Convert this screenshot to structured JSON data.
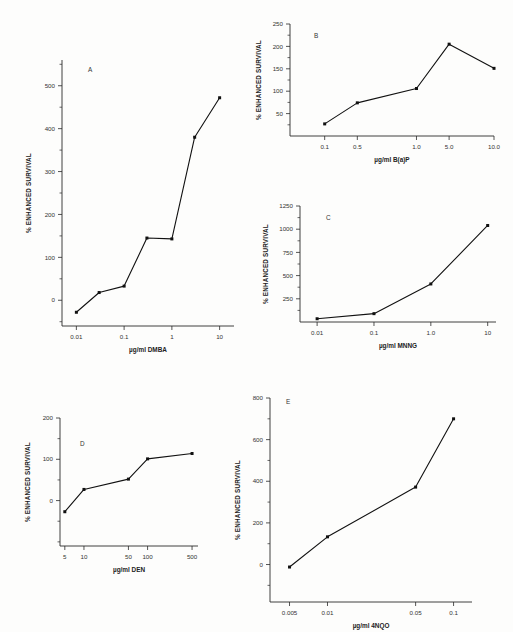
{
  "figure": {
    "title": "",
    "panel_count": 5
  },
  "chart_data": [
    {
      "id": "A",
      "panel_letter": "A",
      "type": "line",
      "title": "",
      "xlabel": "µg/ml DMBA",
      "ylabel": "% ENHANCED SURVIVAL",
      "xscale": "log",
      "xlim": [
        0.005,
        20
      ],
      "ylim": [
        -60,
        560
      ],
      "xticks": [
        0.01,
        0.1,
        1,
        10
      ],
      "xticklabels": [
        "0.01",
        "0.1",
        "1",
        "10"
      ],
      "yticks": [
        0,
        100,
        200,
        300,
        400,
        500
      ],
      "yticklabels": [
        "0",
        "100",
        "200",
        "300",
        "400",
        "500"
      ],
      "yminorticks": [
        -50,
        50,
        150,
        250,
        350,
        450,
        550
      ],
      "grid": false,
      "legend": "none",
      "x": [
        0.01,
        0.03,
        0.1,
        0.3,
        1.0,
        3.0,
        10.0
      ],
      "values": [
        -28,
        18,
        33,
        145,
        143,
        380,
        472
      ]
    },
    {
      "id": "B",
      "panel_letter": "B",
      "type": "line",
      "title": "",
      "xlabel": "µg/ml B(a)P",
      "ylabel": "% ENHANCED SURVIVAL",
      "xscale": "category",
      "ylim": [
        0,
        250
      ],
      "xticks": [
        0.1,
        0.5,
        1.0,
        5.0,
        10.0
      ],
      "xticklabels": [
        "0.1",
        "0.5",
        "1.0",
        "5.0",
        "10.0"
      ],
      "yticks": [
        50,
        100,
        150,
        200,
        250
      ],
      "yticklabels": [
        "50",
        "100",
        "150",
        "200",
        "250"
      ],
      "yminorticks": [
        25,
        75,
        125,
        175,
        225
      ],
      "grid": false,
      "legend": "none",
      "x": [
        0.1,
        0.5,
        1.0,
        5.0,
        10.0
      ],
      "values": [
        27,
        74,
        106,
        205,
        151
      ]
    },
    {
      "id": "C",
      "panel_letter": "C",
      "type": "line",
      "title": "",
      "xlabel": "µg/ml MNNG",
      "ylabel": "% ENHANCED SURVIVAL",
      "xscale": "log",
      "xlim": [
        0.005,
        14
      ],
      "ylim": [
        0,
        1250
      ],
      "xticks": [
        0.01,
        0.1,
        1.0,
        10
      ],
      "xticklabels": [
        "0.01",
        "0.1",
        "1.0",
        "10"
      ],
      "yticks": [
        250,
        500,
        750,
        1000,
        1250
      ],
      "yticklabels": [
        "250",
        "500",
        "750",
        "1000",
        "1250"
      ],
      "yminorticks": [
        125,
        375,
        625,
        875,
        1125
      ],
      "grid": false,
      "legend": "none",
      "x": [
        0.01,
        0.1,
        1.0,
        10
      ],
      "values": [
        35,
        90,
        410,
        1040
      ]
    },
    {
      "id": "D",
      "panel_letter": "D",
      "type": "line",
      "title": "",
      "xlabel": "µg/ml DEN",
      "ylabel": "% ENHANCED SURVIVAL",
      "xscale": "log",
      "xlim": [
        4.2,
        620
      ],
      "ylim": [
        -110,
        200
      ],
      "xticks": [
        5,
        10,
        50,
        100,
        500
      ],
      "xticklabels": [
        "5",
        "10",
        "50",
        "100",
        "500"
      ],
      "yticks": [
        0,
        100,
        200
      ],
      "yticklabels": [
        "0",
        "100",
        "200"
      ],
      "yminorticks": [
        -100,
        -50,
        50,
        150
      ],
      "grid": false,
      "legend": "none",
      "x": [
        5,
        10,
        50,
        100,
        500
      ],
      "values": [
        -27,
        27,
        52,
        101,
        114
      ]
    },
    {
      "id": "E",
      "panel_letter": "E",
      "type": "line",
      "title": "",
      "xlabel": "µg/ml 4NQO",
      "ylabel": "% ENHANCED SURVIVAL",
      "xscale": "log",
      "xlim": [
        0.0035,
        0.14
      ],
      "ylim": [
        -180,
        800
      ],
      "xticks": [
        0.005,
        0.01,
        0.05,
        0.1
      ],
      "xticklabels": [
        "0.005",
        "0.01",
        "0.05",
        "0.1"
      ],
      "yticks": [
        0,
        200,
        400,
        600,
        800
      ],
      "yticklabels": [
        "0",
        "200",
        "400",
        "600",
        "800"
      ],
      "yminorticks": [
        -100,
        100,
        300,
        500,
        700
      ],
      "grid": false,
      "legend": "none",
      "x": [
        0.005,
        0.01,
        0.05,
        0.1
      ],
      "values": [
        -12,
        133,
        372,
        700
      ]
    }
  ]
}
